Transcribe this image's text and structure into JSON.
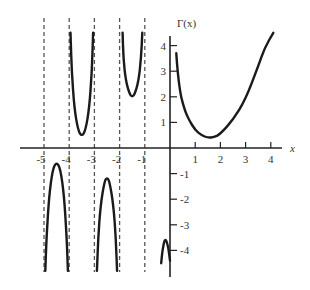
{
  "chart_data": {
    "type": "line",
    "title": "",
    "xlabel": "x",
    "ylabel": "Γ(x)",
    "xlim": [
      -5.5,
      4.5
    ],
    "ylim": [
      -4.8,
      4.5
    ],
    "grid": false,
    "x_ticks": [
      -5,
      -4,
      -3,
      -2,
      -1,
      1,
      2,
      3,
      4
    ],
    "x_tick_labels": [
      "-5",
      "-4",
      "-3",
      "-2",
      "-1",
      "1",
      "2",
      "3",
      "4"
    ],
    "y_ticks": [
      4,
      3,
      2,
      1,
      -1,
      -2,
      -3,
      -4
    ],
    "y_tick_labels": [
      "4",
      "3",
      "2",
      "1",
      "-1",
      "-2",
      "-3",
      "-4"
    ],
    "asymptotes_x": [
      -5,
      -4,
      -3,
      -2,
      -1
    ],
    "series": [
      {
        "name": "Γ(x), x>0",
        "points": [
          [
            0.25,
            3.7
          ],
          [
            0.3,
            3.0
          ],
          [
            0.4,
            2.2
          ],
          [
            0.5,
            1.77
          ],
          [
            0.6,
            1.45
          ],
          [
            0.75,
            1.1
          ],
          [
            1,
            0.7
          ],
          [
            1.25,
            0.5
          ],
          [
            1.5,
            0.4
          ],
          [
            1.75,
            0.42
          ],
          [
            2,
            0.55
          ],
          [
            2.5,
            1.1
          ],
          [
            3,
            1.9
          ],
          [
            3.5,
            3.2
          ],
          [
            3.75,
            3.9
          ],
          [
            4.1,
            4.5
          ]
        ]
      },
      {
        "name": "Γ(x), -1<x<0",
        "points": [
          [
            -0.35,
            -4.5
          ],
          [
            -0.3,
            -4.0
          ],
          [
            -0.2,
            -3.5
          ],
          [
            -0.08,
            -3.8
          ],
          [
            0.0,
            -4.4
          ]
        ]
      },
      {
        "name": "Γ(x), -2<x<-1",
        "points": [
          [
            -1.88,
            4.5
          ],
          [
            -1.85,
            3.5
          ],
          [
            -1.75,
            2.6
          ],
          [
            -1.6,
            2.1
          ],
          [
            -1.5,
            2.0
          ],
          [
            -1.4,
            2.1
          ],
          [
            -1.25,
            2.6
          ],
          [
            -1.15,
            3.5
          ],
          [
            -1.1,
            4.5
          ]
        ]
      },
      {
        "name": "Γ(x), -3<x<-2",
        "points": [
          [
            -2.9,
            -4.8
          ],
          [
            -2.85,
            -3.5
          ],
          [
            -2.75,
            -2.2
          ],
          [
            -2.6,
            -1.3
          ],
          [
            -2.5,
            -1.15
          ],
          [
            -2.4,
            -1.3
          ],
          [
            -2.25,
            -2.2
          ],
          [
            -2.15,
            -3.5
          ],
          [
            -2.1,
            -4.8
          ]
        ]
      },
      {
        "name": "Γ(x), -4<x<-3",
        "points": [
          [
            -3.95,
            4.5
          ],
          [
            -3.9,
            3.0
          ],
          [
            -3.8,
            1.6
          ],
          [
            -3.65,
            0.7
          ],
          [
            -3.5,
            0.45
          ],
          [
            -3.35,
            0.7
          ],
          [
            -3.2,
            1.6
          ],
          [
            -3.1,
            3.0
          ],
          [
            -3.05,
            4.5
          ]
        ]
      },
      {
        "name": "Γ(x), -5<x<-4",
        "points": [
          [
            -4.95,
            -4.8
          ],
          [
            -4.9,
            -3.5
          ],
          [
            -4.8,
            -1.9
          ],
          [
            -4.65,
            -0.8
          ],
          [
            -4.5,
            -0.55
          ],
          [
            -4.35,
            -0.8
          ],
          [
            -4.2,
            -1.9
          ],
          [
            -4.1,
            -3.5
          ],
          [
            -4.05,
            -4.8
          ]
        ]
      }
    ]
  }
}
